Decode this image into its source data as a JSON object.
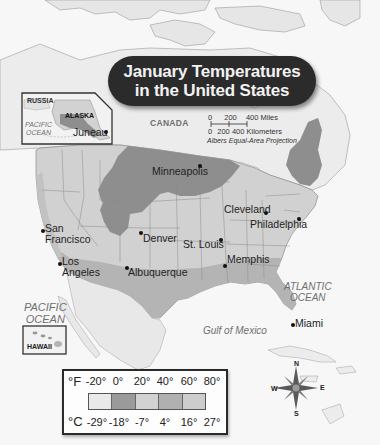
{
  "title": {
    "line1": "January Temperatures",
    "line2": "in the United States"
  },
  "scale": {
    "miles_ticks": [
      "0",
      "200",
      "400 Miles"
    ],
    "km_ticks": [
      "0",
      "200",
      "400 Kilometers"
    ],
    "projection": "Albers Equal-Area Projection"
  },
  "labels": {
    "countries": {
      "canada": "CANADA",
      "mexico": "MEXICO",
      "russia": "RUSSIA"
    },
    "states": {
      "alaska": "ALASKA",
      "hawaii": "HAWAII"
    },
    "water": {
      "pacific_inset": "PACIFIC OCEAN",
      "pacific_inset_line1": "PACIFIC",
      "pacific_inset_line2": "OCEAN",
      "pacific_line1": "PACIFIC",
      "pacific_line2": "OCEAN",
      "atlantic_line1": "ATLANTIC",
      "atlantic_line2": "OCEAN",
      "gulf": "Gulf of Mexico"
    }
  },
  "cities": [
    {
      "name": "Juneau",
      "line1": "Juneau"
    },
    {
      "name": "Minneapolis",
      "line1": "Minneapolis"
    },
    {
      "name": "Cleveland",
      "line1": "Cleveland"
    },
    {
      "name": "Philadelphia",
      "line1": "Philadelphia"
    },
    {
      "name": "San Francisco",
      "line1": "San",
      "line2": "Francisco"
    },
    {
      "name": "Denver",
      "line1": "Denver"
    },
    {
      "name": "St. Louis",
      "line1": "St. Louis"
    },
    {
      "name": "Los Angeles",
      "line1": "Los",
      "line2": "Angeles"
    },
    {
      "name": "Albuquerque",
      "line1": "Albuquerque"
    },
    {
      "name": "Memphis",
      "line1": "Memphis"
    },
    {
      "name": "Miami",
      "line1": "Miami"
    }
  ],
  "legend": {
    "fahrenheit_unit": "°F",
    "celsius_unit": "°C",
    "fahrenheit_ticks": [
      "-20°",
      "0°",
      "20°",
      "40°",
      "60°",
      "80°"
    ],
    "celsius_ticks": [
      "-29°",
      "-18°",
      "-7°",
      "4°",
      "16°",
      "27°"
    ],
    "bands": [
      {
        "range_f": "-20° to 0°",
        "range_c": "-29° to -18°",
        "color": "#e9e9e9"
      },
      {
        "range_f": "0° to 20°",
        "range_c": "-18° to -7°",
        "color": "#9a9a9a"
      },
      {
        "range_f": "20° to 40°",
        "range_c": "-7° to 4°",
        "color": "#d2d2d2"
      },
      {
        "range_f": "40° to 60°",
        "range_c": "4° to 16°",
        "color": "#b0b0b0"
      },
      {
        "range_f": "60° to 80°",
        "range_c": "16° to 27°",
        "color": "#cdcdcd"
      }
    ]
  },
  "compass": {
    "n": "N",
    "e": "E",
    "s": "S",
    "w": "W"
  },
  "colors": {
    "title_bg": "#2b2b2b",
    "title_text": "#f2f2f2",
    "land_base": "#e9e9e9",
    "band_cold": "#8e8e8e",
    "band_cool": "#c4c4c4",
    "band_mild": "#b3b3b3",
    "water": "#f7f7f7"
  }
}
